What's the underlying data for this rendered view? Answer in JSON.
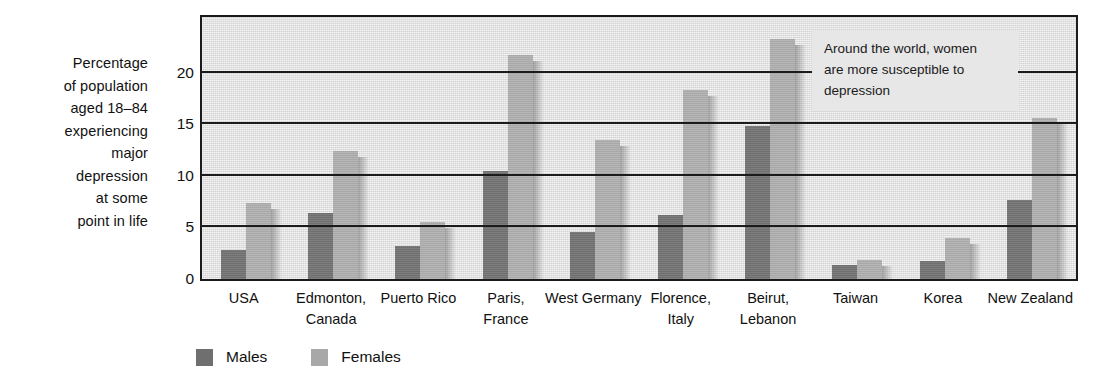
{
  "chart_data": {
    "type": "bar",
    "title": "",
    "subtitle": "",
    "xlabel": "",
    "ylabel": "Percentage of population aged 18–84 experiencing major depression at some point in life",
    "ylabel_lines": [
      "Percentage",
      "of population",
      "aged 18–84",
      "experiencing",
      "major",
      "depression",
      "at some",
      "point in life"
    ],
    "ylim": [
      0,
      25.4
    ],
    "yticks": [
      0,
      5,
      10,
      15,
      20
    ],
    "ytick_labels": [
      "0",
      "5",
      "10",
      "15",
      "20"
    ],
    "grid": true,
    "grid_axis": "y",
    "legend_position": "bottom-left",
    "categories": [
      "USA",
      "Edmonton, Canada",
      "Puerto Rico",
      "Paris, France",
      "West Germany",
      "Florence, Italy",
      "Beirut, Lebanon",
      "Taiwan",
      "Korea",
      "New Zealand"
    ],
    "category_lines": [
      [
        "USA"
      ],
      [
        "Edmonton,",
        "Canada"
      ],
      [
        "Puerto Rico"
      ],
      [
        "Paris,",
        "France"
      ],
      [
        "West Germany"
      ],
      [
        "Florence,",
        "Italy"
      ],
      [
        "Beirut,",
        "Lebanon"
      ],
      [
        "Taiwan"
      ],
      [
        "Korea"
      ],
      [
        "New Zealand"
      ]
    ],
    "series": [
      {
        "name": "Males",
        "color": "#6f6f6f",
        "values": [
          2.8,
          6.4,
          3.2,
          10.5,
          4.6,
          6.2,
          14.8,
          1.4,
          1.7,
          7.7
        ]
      },
      {
        "name": "Females",
        "color": "#a8a8a8",
        "values": [
          7.4,
          12.4,
          5.5,
          21.7,
          13.5,
          18.3,
          23.3,
          1.8,
          4.0,
          15.6
        ]
      }
    ],
    "annotations": [
      {
        "id": "women-susceptible-note",
        "text": "Around the world, women are more susceptible to depression",
        "lines": [
          "Around the world, women",
          "are more susceptible to",
          "depression"
        ]
      }
    ]
  },
  "legend": {
    "items": [
      {
        "label": "Males",
        "swatch": "male-swatch"
      },
      {
        "label": "Females",
        "swatch": "female-swatch"
      }
    ]
  },
  "colors": {
    "male_bar": "#6f6f6f",
    "female_bar": "#a8a8a8",
    "plot_background": "#d2d2d2",
    "axis": "#1b1b1b",
    "annotation_background": "#e7e7e7",
    "text": "#111111"
  }
}
